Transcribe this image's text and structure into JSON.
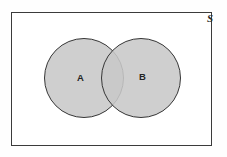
{
  "figure": {
    "type": "venn-diagram",
    "title": "",
    "background_color": "#ffffff",
    "universal_set": {
      "label": "S",
      "shape": "rectangle",
      "stroke_color": "#3b3b3b",
      "fill_color": "#ffffff"
    },
    "sets": [
      {
        "label": "A",
        "shape": "circle",
        "fill_color": "#c8c8c8",
        "stroke_color": "#363636"
      },
      {
        "label": "B",
        "shape": "circle",
        "fill_color": "#c8c8c8",
        "stroke_color": "#363636"
      }
    ],
    "relation": "overlapping"
  }
}
